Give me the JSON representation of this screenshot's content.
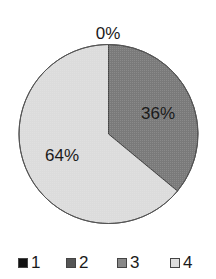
{
  "chart_data": {
    "type": "pie",
    "title": "",
    "categories": [
      "1",
      "2",
      "3",
      "4"
    ],
    "values": [
      0,
      36,
      0,
      64
    ],
    "labels": [
      "0%",
      "36%",
      "",
      "64%"
    ],
    "colors": [
      "#111111",
      "#7a7a7a",
      "#8c8c8c",
      "#dcdcdc"
    ],
    "start_angle_deg": 0,
    "direction": "clockwise",
    "legend_position": "bottom"
  },
  "labels": {
    "zero": "0%",
    "s2": "36%",
    "s4": "64%"
  },
  "legend": [
    {
      "label": "1",
      "color": "#111111"
    },
    {
      "label": "2",
      "color": "#555555"
    },
    {
      "label": "3",
      "color": "#888888"
    },
    {
      "label": "4",
      "color": "#dedede"
    }
  ]
}
